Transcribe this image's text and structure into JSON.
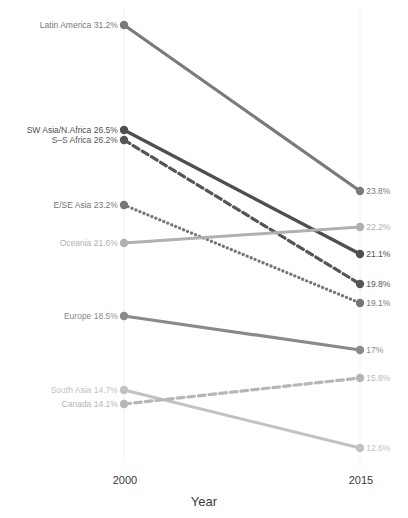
{
  "chart_data": {
    "type": "line",
    "subtype": "slope-chart",
    "title": "",
    "subtitle": "",
    "xlabel": "Year",
    "ylabel": "",
    "x": [
      "2000",
      "2015"
    ],
    "categories": [
      "2000",
      "2015"
    ],
    "tick_labels": {
      "x": [
        "2000",
        "2015"
      ],
      "y": []
    },
    "axis_ranges": {
      "x": [
        "2000",
        "2015"
      ],
      "y": [
        12.0,
        32.0
      ]
    },
    "grid": "vertical-faint",
    "legend": "inline-endpoint-labels",
    "legend_position": "none",
    "value_suffix": "%",
    "series": [
      {
        "name": "Latin America",
        "values": [
          31.2,
          23.8
        ],
        "left_label": "Latin America 31.2%",
        "right_label": "23.8%",
        "style": "solid",
        "color": "#7a7a7a",
        "width": 3.2,
        "left_y": 25,
        "right_y": 191
      },
      {
        "name": "SW Asia/N.Africa",
        "values": [
          26.5,
          21.1
        ],
        "left_label": "SW Asia/N.Africa 26.5%",
        "right_label": "21.1%",
        "style": "solid",
        "color": "#4f4f4f",
        "width": 3.4,
        "left_y": 130,
        "right_y": 254
      },
      {
        "name": "S-S Africa",
        "values": [
          26.2,
          19.8
        ],
        "left_label": "S–S Africa 26.2%",
        "right_label": "19.8%",
        "style": "dashed",
        "color": "#565656",
        "width": 3.2,
        "left_y": 140,
        "right_y": 284
      },
      {
        "name": "E/SE Asia",
        "values": [
          23.2,
          19.1
        ],
        "left_label": "E/SE Asia 23.2%",
        "right_label": "19.1%",
        "style": "dotted",
        "color": "#767676",
        "width": 3.2,
        "left_y": 205,
        "right_y": 303
      },
      {
        "name": "Oceania",
        "values": [
          21.6,
          22.2
        ],
        "left_label": "Oceania 21.6%",
        "right_label": "22.2%",
        "style": "solid",
        "color": "#b0b0b0",
        "width": 3.0,
        "left_y": 243,
        "right_y": 227
      },
      {
        "name": "Europe",
        "values": [
          18.5,
          17.0
        ],
        "left_label": "Europe 18.5%",
        "right_label": "17%",
        "style": "solid",
        "color": "#8a8a8a",
        "width": 3.2,
        "left_y": 316,
        "right_y": 350
      },
      {
        "name": "South Asia",
        "values": [
          14.7,
          12.6
        ],
        "left_label": "South Asia 14.7%",
        "right_label": "12.6%",
        "style": "solid",
        "color": "#c2c2c2",
        "width": 3.0,
        "left_y": 390,
        "right_y": 448
      },
      {
        "name": "Canada",
        "values": [
          14.1,
          15.8
        ],
        "left_label": "Canada 14.1%",
        "right_label": "15.8%",
        "style": "dashed",
        "color": "#b6b6b6",
        "width": 3.2,
        "left_y": 404,
        "right_y": 378
      }
    ]
  },
  "axis": {
    "x_tick_left": "2000",
    "x_tick_right": "2015",
    "title": "Year"
  },
  "colors": {
    "background": "#ffffff",
    "text": "#3a3a3a",
    "gridline": "#f0f0f0",
    "darkest_series": "#4f4f4f",
    "lightest_series": "#c2c2c2"
  },
  "geometry": {
    "x_left": 124,
    "x_right": 360,
    "dot_radius": 4.2,
    "gridline_top": 8,
    "gridline_bottom": 462
  }
}
